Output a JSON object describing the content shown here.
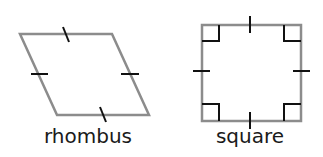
{
  "diagram": {
    "shapes": [
      {
        "name": "rhombus",
        "label": "rhombus",
        "vertices": [
          [
            20,
            34
          ],
          [
            112,
            34
          ],
          [
            149,
            115
          ],
          [
            57,
            115
          ]
        ],
        "equal_side_marks": 4,
        "right_angle_marks": 0
      },
      {
        "name": "square",
        "label": "square",
        "vertices": [
          [
            202,
            25
          ],
          [
            301,
            25
          ],
          [
            301,
            121
          ],
          [
            202,
            121
          ]
        ],
        "equal_side_marks": 4,
        "right_angle_marks": 4
      }
    ],
    "colors": {
      "outline": "#8c8c8c",
      "marks": "#111111",
      "text": "#1a1a1a"
    }
  }
}
